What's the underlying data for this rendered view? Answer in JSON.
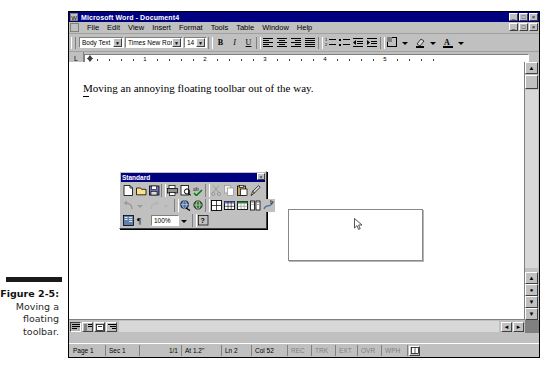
{
  "figure": {
    "number": "Figure 2-5:",
    "line1": "Moving a",
    "line2": "floating",
    "line3": "toolbar."
  },
  "window": {
    "app_icon": "word-w-icon",
    "title": "Microsoft Word - Document4",
    "buttons": [
      {
        "name": "minimize-button",
        "glyph": "_"
      },
      {
        "name": "maximize-button",
        "glyph": "□"
      },
      {
        "name": "close-button",
        "glyph": "×"
      }
    ],
    "doc_buttons": [
      {
        "name": "doc-minimize-button",
        "glyph": "_"
      },
      {
        "name": "doc-restore-button",
        "glyph": "□"
      },
      {
        "name": "doc-close-button",
        "glyph": "×"
      }
    ]
  },
  "menubar": {
    "doc_icon": "document-control-icon",
    "items": [
      {
        "label": "File",
        "accel": "F"
      },
      {
        "label": "Edit",
        "accel": "E"
      },
      {
        "label": "View",
        "accel": "V"
      },
      {
        "label": "Insert",
        "accel": "I"
      },
      {
        "label": "Format",
        "accel": "o"
      },
      {
        "label": "Tools",
        "accel": "T"
      },
      {
        "label": "Table",
        "accel": "a"
      },
      {
        "label": "Window",
        "accel": "W"
      },
      {
        "label": "Help",
        "accel": "H"
      }
    ]
  },
  "formatting_toolbar": {
    "style": "Body Text",
    "font": "Times New Roman",
    "size": "14",
    "buttons": [
      {
        "name": "bold-button",
        "glyph": "B"
      },
      {
        "name": "italic-button",
        "glyph": "I"
      },
      {
        "name": "underline-button",
        "glyph": "U"
      },
      {
        "name": "align-left-button",
        "glyph": "align-left-icon"
      },
      {
        "name": "align-center-button",
        "glyph": "align-center-icon"
      },
      {
        "name": "align-right-button",
        "glyph": "align-right-icon"
      },
      {
        "name": "justify-button",
        "glyph": "justify-icon"
      },
      {
        "name": "numbered-list-button",
        "glyph": "numbered-list-icon"
      },
      {
        "name": "bulleted-list-button",
        "glyph": "bulleted-list-icon"
      },
      {
        "name": "decrease-indent-button",
        "glyph": "decrease-indent-icon"
      },
      {
        "name": "increase-indent-button",
        "glyph": "increase-indent-icon"
      },
      {
        "name": "borders-button",
        "glyph": "borders-icon"
      },
      {
        "name": "highlight-button",
        "glyph": "highlight-icon"
      },
      {
        "name": "font-color-button",
        "glyph": "font-color-icon"
      }
    ]
  },
  "ruler": {
    "marks": [
      "1",
      "2",
      "3",
      "4",
      "5"
    ],
    "tab_stop_label": "L"
  },
  "document": {
    "body_text": "Moving an annoying floating toolbar out of the way.",
    "drop_target_name": "drop-target-rectangle",
    "cursor_name": "mouse-pointer"
  },
  "floating_toolbar": {
    "title": "Standard",
    "close_glyph": "×",
    "zoom_value": "100%",
    "row1": [
      {
        "name": "new-document-button",
        "icon": "new-document-icon"
      },
      {
        "name": "open-button",
        "icon": "open-folder-icon"
      },
      {
        "name": "save-button",
        "icon": "floppy-disk-icon"
      },
      {
        "name": "print-button",
        "icon": "printer-icon"
      },
      {
        "name": "print-preview-button",
        "icon": "print-preview-icon"
      },
      {
        "name": "spelling-button",
        "icon": "spelling-check-icon"
      },
      {
        "name": "cut-button",
        "icon": "scissors-icon"
      },
      {
        "name": "copy-button",
        "icon": "copy-icon"
      },
      {
        "name": "paste-button",
        "icon": "clipboard-paste-icon"
      },
      {
        "name": "format-painter-button",
        "icon": "paintbrush-icon"
      }
    ],
    "row2": [
      {
        "name": "undo-button",
        "icon": "undo-arrow-icon"
      },
      {
        "name": "undo-dropdown",
        "icon": "chevron-down-icon"
      },
      {
        "name": "redo-button",
        "icon": "redo-arrow-icon"
      },
      {
        "name": "redo-dropdown",
        "icon": "chevron-down-icon"
      },
      {
        "name": "insert-hyperlink-button",
        "icon": "globe-link-icon"
      },
      {
        "name": "web-toolbar-button",
        "icon": "web-globe-icon"
      },
      {
        "name": "tables-and-borders-button",
        "icon": "tables-borders-icon"
      },
      {
        "name": "insert-table-button",
        "icon": "insert-table-icon"
      },
      {
        "name": "insert-excel-sheet-button",
        "icon": "excel-sheet-icon"
      },
      {
        "name": "columns-button",
        "icon": "columns-icon"
      },
      {
        "name": "drawing-button",
        "icon": "drawing-icon"
      }
    ],
    "row3": [
      {
        "name": "document-map-button",
        "icon": "document-map-icon"
      },
      {
        "name": "show-formatting-button",
        "icon": "pilcrow-icon"
      },
      {
        "name": "help-button",
        "icon": "help-question-icon"
      }
    ]
  },
  "scrollbars": {
    "up_glyph": "▲",
    "down_glyph": "▼",
    "left_glyph": "◄",
    "right_glyph": "►",
    "prev_page_glyph": "▲",
    "select_browse_glyph": "●",
    "next_page_glyph": "▼"
  },
  "view_buttons": [
    {
      "name": "normal-view-button",
      "icon": "normal-view-icon",
      "active": true
    },
    {
      "name": "online-layout-view-button",
      "icon": "online-layout-icon",
      "active": false
    },
    {
      "name": "page-layout-view-button",
      "icon": "page-layout-icon",
      "active": false
    },
    {
      "name": "outline-view-button",
      "icon": "outline-view-icon",
      "active": false
    }
  ],
  "statusbar": {
    "page": "Page 1",
    "section": "Sec 1",
    "pages": "1/1",
    "at": "At 1.2\"",
    "line": "Ln 2",
    "column": "Col 52",
    "rec": "REC",
    "trk": "TRK",
    "ext": "EXT",
    "ovr": "OVR",
    "lang": "WPH",
    "spell_icon": "spell-check-book-icon"
  }
}
